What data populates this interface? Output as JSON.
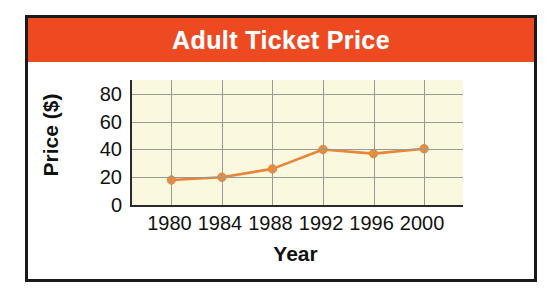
{
  "figure": {
    "border_color": "#1a1a1a",
    "background": "#ffffff"
  },
  "title_band": {
    "background": "#ee4a22",
    "text_color": "#ffffff",
    "title": "Adult Ticket Price"
  },
  "chart_data": {
    "type": "line",
    "title": "Adult Ticket Price",
    "xlabel": "Year",
    "ylabel": "Price ($)",
    "categories": [
      "1980",
      "1984",
      "1988",
      "1992",
      "1996",
      "2000"
    ],
    "x": [
      1980,
      1984,
      1988,
      1992,
      1996,
      2000
    ],
    "values": [
      18,
      20,
      26,
      40,
      37,
      40.5
    ],
    "series": [
      {
        "name": "Adult Ticket Price",
        "values": [
          18,
          20,
          26,
          40,
          37,
          40.5
        ],
        "color": "#e8853a",
        "marker": "circle",
        "marker_color": "#f08a33"
      }
    ],
    "ylim": [
      0,
      90
    ],
    "yticks": [
      0,
      20,
      40,
      60,
      80
    ],
    "ytick_labels": [
      "0",
      "20",
      "40",
      "60",
      "80"
    ],
    "xtick_labels": [
      "1980",
      "1984",
      "1988",
      "1992",
      "1996",
      "2000"
    ],
    "grid": true,
    "grid_color": "#9a9a92",
    "plot_background": "#faf8de",
    "legend": null,
    "legend_position": "none",
    "annotations": []
  },
  "axes": {
    "y_title": "Price ($)",
    "x_title": "Year"
  }
}
